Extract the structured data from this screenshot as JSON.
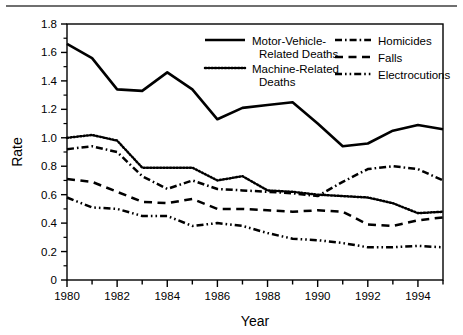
{
  "chart_data": {
    "type": "line",
    "title": "",
    "xlabel": "Year",
    "ylabel": "Rate",
    "xlim": [
      1980,
      1995
    ],
    "ylim": [
      0,
      1.8
    ],
    "xticks": [
      1980,
      1981,
      1982,
      1983,
      1984,
      1985,
      1986,
      1987,
      1988,
      1989,
      1990,
      1991,
      1992,
      1993,
      1994,
      1995
    ],
    "xtick_labels": [
      "1980",
      "",
      "1982",
      "",
      "1984",
      "",
      "1986",
      "",
      "1988",
      "",
      "1990",
      "",
      "1992",
      "",
      "1994",
      ""
    ],
    "yticks": [
      0,
      0.2,
      0.4,
      0.6,
      0.8,
      1.0,
      1.2,
      1.4,
      1.6,
      1.8
    ],
    "ytick_labels": [
      "0",
      "0.2",
      "0.4",
      "0.6",
      "0.8",
      "1.0",
      "1.2",
      "1.4",
      "1.6",
      "1.8"
    ],
    "yticks_minor": [
      0.1,
      0.3,
      0.5,
      0.7,
      0.9,
      1.1,
      1.3,
      1.5,
      1.7
    ],
    "grid": false,
    "legend_position": "top-right-inside",
    "x": [
      1980,
      1981,
      1982,
      1983,
      1984,
      1985,
      1986,
      1987,
      1988,
      1989,
      1990,
      1991,
      1992,
      1993,
      1994,
      1995
    ],
    "series": [
      {
        "name": "Motor-Vehicle-Related Deaths",
        "style": "solid",
        "values": [
          1.66,
          1.56,
          1.34,
          1.33,
          1.46,
          1.34,
          1.13,
          1.21,
          1.23,
          1.25,
          1.1,
          0.94,
          0.96,
          1.05,
          1.09,
          1.06
        ]
      },
      {
        "name": "Machine-Related Deaths",
        "style": "dotted",
        "values": [
          1.0,
          1.02,
          0.98,
          0.79,
          0.79,
          0.79,
          0.7,
          0.73,
          0.63,
          0.62,
          0.6,
          0.59,
          0.58,
          0.54,
          0.47,
          0.48
        ]
      },
      {
        "name": "Homicides",
        "style": "dash-dot",
        "values": [
          0.92,
          0.94,
          0.9,
          0.73,
          0.64,
          0.7,
          0.64,
          0.63,
          0.62,
          0.61,
          0.59,
          0.69,
          0.78,
          0.8,
          0.78,
          0.7
        ]
      },
      {
        "name": "Falls",
        "style": "dashed",
        "values": [
          0.71,
          0.69,
          0.62,
          0.55,
          0.54,
          0.57,
          0.5,
          0.5,
          0.49,
          0.48,
          0.49,
          0.48,
          0.39,
          0.38,
          0.42,
          0.44
        ]
      },
      {
        "name": "Electrocutions",
        "style": "dash-dot-dot",
        "values": [
          0.58,
          0.51,
          0.5,
          0.45,
          0.45,
          0.38,
          0.4,
          0.38,
          0.33,
          0.29,
          0.28,
          0.26,
          0.23,
          0.23,
          0.24,
          0.23
        ]
      }
    ],
    "legend": [
      {
        "label_line1": "Motor-Vehicle-",
        "label_line2": "Related Deaths",
        "style": "solid"
      },
      {
        "label_line1": "Machine-Related",
        "label_line2": "Deaths",
        "style": "dotted"
      },
      {
        "label_line1": "Homicides",
        "label_line2": "",
        "style": "dash-dot"
      },
      {
        "label_line1": "Falls",
        "label_line2": "",
        "style": "dashed"
      },
      {
        "label_line1": "Electrocutions",
        "label_line2": "",
        "style": "dash-dot-dot"
      }
    ],
    "colors": {
      "line": "#000000",
      "axis": "#000000",
      "background": "#ffffff",
      "rule": "#6f6f6f"
    }
  }
}
